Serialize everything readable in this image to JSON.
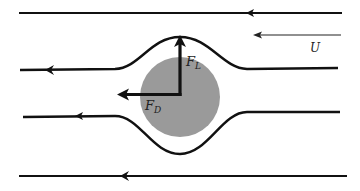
{
  "diagram": {
    "colors": {
      "line": "#111111",
      "cylinder": "#9a9a9a",
      "background": "#ffffff"
    },
    "labels": {
      "free_stream": "U",
      "lift_force": "F",
      "lift_subscript": "L",
      "drag_force": "F",
      "drag_subscript": "D"
    },
    "streamlines": [
      {
        "name": "top-straight",
        "direction": "left"
      },
      {
        "name": "upper-deflected",
        "direction": "left"
      },
      {
        "name": "lower-deflected",
        "direction": "left"
      },
      {
        "name": "bottom-straight",
        "direction": "left"
      }
    ],
    "forces": [
      {
        "name": "lift",
        "direction": "up"
      },
      {
        "name": "drag",
        "direction": "left"
      }
    ]
  }
}
